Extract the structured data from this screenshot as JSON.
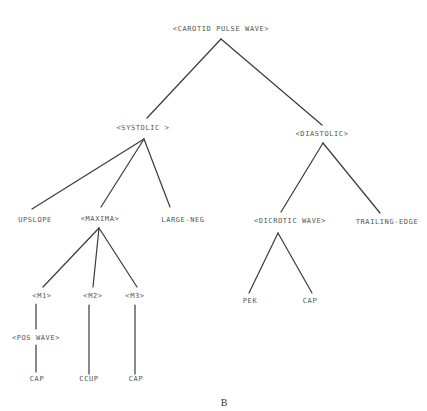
{
  "diagram": {
    "type": "parse-tree",
    "caption": "B",
    "nodes": {
      "root": "<CAROTID PULSE WAVE>",
      "systolic": "<SYSTOLIC >",
      "diastolic": "<DIASTOLIC>",
      "upslope": "UPSLOPE",
      "maxima": "<MAXIMA>",
      "large_neg": "LARGE-NEG",
      "dicrotic_wave": "<DICROTIC WAVE>",
      "trailing_edge": "TRAILING-EDGE",
      "m1": "<M1>",
      "m2": "<M2>",
      "m3": "<M3>",
      "pek": "PEK",
      "dicrotic_cap": "CAP",
      "pos_wave": "<POS WAVE>",
      "m1_cap": "CAP",
      "m2_ccup": "CCUP",
      "m3_cap": "CAP"
    },
    "edges": [
      [
        "root",
        "systolic"
      ],
      [
        "root",
        "diastolic"
      ],
      [
        "systolic",
        "upslope"
      ],
      [
        "systolic",
        "maxima"
      ],
      [
        "systolic",
        "large_neg"
      ],
      [
        "diastolic",
        "dicrotic_wave"
      ],
      [
        "diastolic",
        "trailing_edge"
      ],
      [
        "maxima",
        "m1"
      ],
      [
        "maxima",
        "m2"
      ],
      [
        "maxima",
        "m3"
      ],
      [
        "dicrotic_wave",
        "pek"
      ],
      [
        "dicrotic_wave",
        "dicrotic_cap"
      ],
      [
        "m1",
        "pos_wave"
      ],
      [
        "pos_wave",
        "m1_cap"
      ],
      [
        "m2",
        "m2_ccup"
      ],
      [
        "m3",
        "m3_cap"
      ]
    ]
  }
}
